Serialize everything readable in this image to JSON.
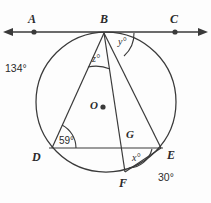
{
  "figure": {
    "type": "circle-geometry-diagram",
    "stroke_color": "#3a3a3a",
    "background_color": "#fdfdfd",
    "canvas": {
      "width": 211,
      "height": 203
    }
  },
  "points": {
    "A": {
      "label": "A",
      "x": 34,
      "y": 32,
      "dot": true
    },
    "B": {
      "label": "B",
      "x": 104,
      "y": 32,
      "dot": false
    },
    "C": {
      "label": "C",
      "x": 175,
      "y": 32,
      "dot": true
    },
    "O": {
      "label": "O",
      "x": 100,
      "y": 107,
      "dot": true
    },
    "D": {
      "label": "D",
      "x": 52,
      "y": 148,
      "dot": false
    },
    "E": {
      "label": "E",
      "x": 161,
      "y": 148,
      "dot": false
    },
    "F": {
      "label": "F",
      "x": 125,
      "y": 172,
      "dot": false
    },
    "G": {
      "label": "G",
      "x": 129,
      "y": 143,
      "dot": false
    }
  },
  "labels": {
    "A": "A",
    "B": "B",
    "C": "C",
    "O": "O",
    "D": "D",
    "E": "E",
    "F": "F",
    "G": "G"
  },
  "angles": {
    "z": "z°",
    "y": "y°",
    "x": "x°",
    "at_D": "59°"
  },
  "arcs": {
    "arc_BD": "134°",
    "arc_FE": "30°"
  },
  "circle": {
    "cx": 106,
    "cy": 102,
    "r": 70
  },
  "tangent_line": {
    "y": 32,
    "x_start": 8,
    "x_end": 203,
    "arrows": "both"
  },
  "chords": [
    {
      "name": "BD",
      "from": "B",
      "to": "D"
    },
    {
      "name": "BF",
      "from": "B",
      "to": "F"
    },
    {
      "name": "BE",
      "from": "B",
      "to": "E"
    },
    {
      "name": "DE",
      "from": "D",
      "to": "E"
    },
    {
      "name": "FE",
      "from": "F",
      "to": "E"
    }
  ]
}
